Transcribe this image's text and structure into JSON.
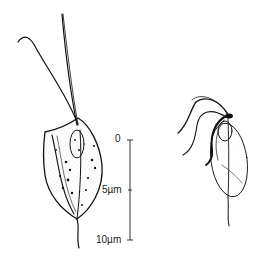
{
  "figure": {
    "scale_bar": {
      "ticks": [
        {
          "label": "0",
          "y": 140
        },
        {
          "label": "5µm",
          "y": 190
        },
        {
          "label": "10µm",
          "y": 240
        }
      ]
    },
    "colors": {
      "ink": "#111111",
      "stipple": "#9a9a9a",
      "background": "#ffffff"
    }
  }
}
